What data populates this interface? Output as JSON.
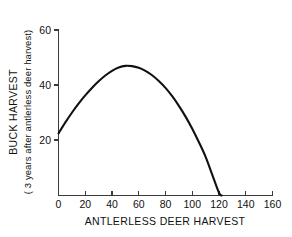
{
  "chart_data": {
    "type": "line",
    "title": "",
    "xlabel": "ANTLERLESS DEER HARVEST",
    "ylabel": "BUCK HARVEST",
    "ylabel_sub": "( 3 years after antlerless deer harvest)",
    "xlim": [
      0,
      160
    ],
    "ylim": [
      0,
      60
    ],
    "xticks": [
      0,
      20,
      40,
      60,
      80,
      100,
      120,
      140,
      160
    ],
    "xticklabels": [
      "0",
      "20",
      "40",
      "60",
      "80",
      "100",
      "120",
      "140",
      "160"
    ],
    "yticks": [
      20,
      40,
      60
    ],
    "yticklabels": [
      "20",
      "40",
      "60"
    ],
    "grid": false,
    "legend": false,
    "legend_position": "none",
    "line_color": "#111111",
    "axis_color": "#3a3a3a",
    "background_color": "#ffffff",
    "series": [
      {
        "name": "buck harvest response",
        "x": [
          0,
          5,
          10,
          15,
          20,
          25,
          30,
          35,
          40,
          45,
          50,
          55,
          60,
          65,
          70,
          75,
          80,
          85,
          90,
          95,
          100,
          105,
          110,
          115,
          120,
          122
        ],
        "y": [
          22.5,
          26.4,
          30.0,
          33.3,
          36.3,
          39.0,
          41.4,
          43.5,
          45.2,
          46.4,
          47.0,
          46.9,
          46.3,
          45.2,
          43.6,
          41.5,
          39.0,
          36.0,
          32.5,
          28.6,
          24.2,
          19.3,
          14.0,
          7.5,
          1.0,
          0.0
        ]
      }
    ],
    "annotations": {
      "peak_x": 50,
      "peak_y": 47,
      "y_intercept": 22.5,
      "x_intercept": 122
    }
  },
  "labels": {
    "xtick_0": "0",
    "xtick_1": "20",
    "xtick_2": "40",
    "xtick_3": "60",
    "xtick_4": "80",
    "xtick_5": "100",
    "xtick_6": "120",
    "xtick_7": "140",
    "xtick_8": "160",
    "ytick_0": "20",
    "ytick_1": "40",
    "ytick_2": "60"
  }
}
